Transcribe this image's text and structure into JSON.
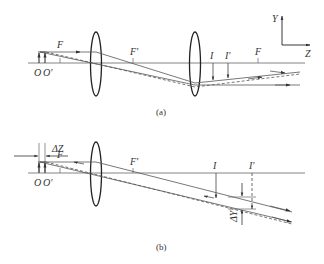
{
  "diagram_a": {
    "caption": "(a)",
    "labels": {
      "object_o": "O",
      "object_o_prime": "O'",
      "front_focus": "F",
      "rear_focus_lens1": "F'",
      "image_i": "I",
      "image_i_prime": "I'",
      "rear_focus_lens2": "F"
    },
    "coordinate_axes": {
      "y_label": "Y",
      "z_label": "Z"
    }
  },
  "diagram_b": {
    "caption": "(b)",
    "labels": {
      "delta_z": "ΔZ",
      "object_o": "O",
      "object_o_prime": "O'",
      "front_focus": "F",
      "rear_focus": "F'",
      "image_i": "I",
      "image_i_prime": "I'",
      "delta_y": "ΔY"
    }
  },
  "colors": {
    "lens": "#222222",
    "ray": "#555555",
    "axis": "#777777",
    "text": "#333333"
  }
}
